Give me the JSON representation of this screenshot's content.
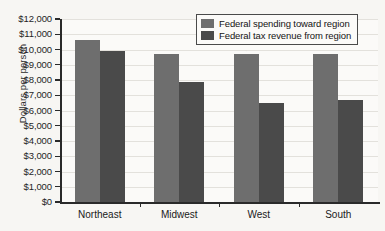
{
  "chart_data": {
    "type": "bar",
    "title": "",
    "subtitle": "",
    "xlabel": "",
    "ylabel": "Dollars per person",
    "categories": [
      "Northeast",
      "Midwest",
      "West",
      "South"
    ],
    "series": [
      {
        "name": "Federal spending toward region",
        "color": "#6e6e6e",
        "values": [
          10600,
          9700,
          9700,
          9700
        ]
      },
      {
        "name": "Federal tax revenue from region",
        "color": "#4a4a4a",
        "values": [
          9900,
          7900,
          6500,
          6700
        ]
      }
    ],
    "ylim": [
      0,
      12000
    ],
    "ytick_step": 1000,
    "ytick_labels": [
      "$12,000",
      "$11,000",
      "$10,000",
      "$9,000",
      "$8,000",
      "$7,000",
      "$6,000",
      "$5,000",
      "$4,000",
      "$3,000",
      "$2,000",
      "$1,000",
      "$0"
    ],
    "ytick_values": [
      12000,
      11000,
      10000,
      9000,
      8000,
      7000,
      6000,
      5000,
      4000,
      3000,
      2000,
      1000,
      0
    ],
    "grid": true,
    "grid_axis": "y",
    "legend_position": "top-right",
    "legend_inside_plot": true,
    "background_color": "#f7f6f3",
    "plot_background_color": "#fbfaf8",
    "axis_color": "#2a2a2a"
  }
}
